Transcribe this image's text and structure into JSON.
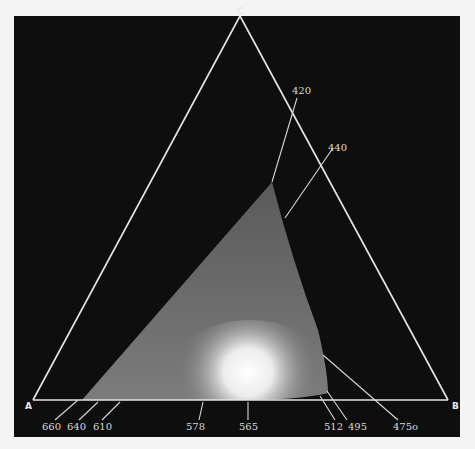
{
  "diagram": {
    "type": "chromaticity-triangle",
    "vertices": [
      {
        "label": "A",
        "x": 33,
        "y": 400
      },
      {
        "label": "B",
        "x": 448,
        "y": 400
      },
      {
        "label": "C",
        "x": 240,
        "y": 22
      }
    ],
    "wavelength_labels": [
      {
        "text": "420",
        "x": 302,
        "y": 122
      },
      {
        "text": "440",
        "x": 336,
        "y": 151
      },
      {
        "text": "660",
        "x": 42,
        "y": 430
      },
      {
        "text": "640",
        "x": 68,
        "y": 430
      },
      {
        "text": "610",
        "x": 93,
        "y": 430
      },
      {
        "text": "578",
        "x": 186,
        "y": 430
      },
      {
        "text": "565",
        "x": 239,
        "y": 430
      },
      {
        "text": "512",
        "x": 325,
        "y": 430
      },
      {
        "text": "495",
        "x": 349,
        "y": 430
      },
      {
        "text": "475o",
        "x": 394,
        "y": 430
      }
    ],
    "colors": {
      "background": "#0e0e0e",
      "page": "#f4f4f4",
      "lines": "#e6e6e6",
      "gamut": "#6a6a6a",
      "hotspot": "#ffffff"
    }
  }
}
